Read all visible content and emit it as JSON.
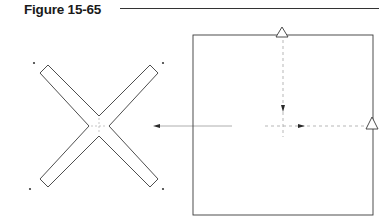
{
  "figure": {
    "title": "Figure 15-65"
  },
  "colors": {
    "stroke": "#3a3a3a",
    "guide": "#9a9a9a",
    "title": "#1a1a1a"
  },
  "diagram": {
    "cross_shape": {
      "center": [
        99,
        126
      ],
      "arm_half_width": 7,
      "arm_length": 70,
      "hole_count": 4
    },
    "square_shape": {
      "left": 193,
      "top": 35,
      "right": 373,
      "bottom": 215
    },
    "markers": [
      {
        "type": "triangle",
        "position": "top-edge",
        "x": 282,
        "y": 32
      },
      {
        "type": "triangle",
        "position": "right-edge",
        "x": 372,
        "y": 123
      }
    ],
    "arrows": [
      {
        "label": "transform-arrow",
        "from": [
          232,
          126
        ],
        "to": [
          153,
          126
        ],
        "direction": "left"
      },
      {
        "label": "vertical-fold-guide",
        "from": [
          283,
          40
        ],
        "to": [
          283,
          137
        ],
        "direction": "down"
      },
      {
        "label": "horizontal-fold-guide",
        "from": [
          370,
          126
        ],
        "to": [
          265,
          126
        ],
        "direction": "right"
      }
    ]
  }
}
